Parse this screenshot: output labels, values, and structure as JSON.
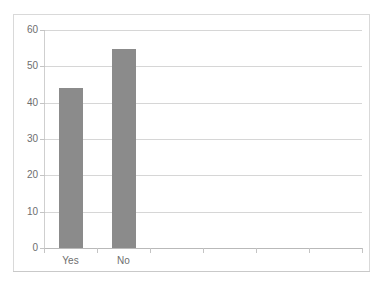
{
  "title_fragment": "",
  "chart_data": {
    "type": "bar",
    "title": "",
    "subtitle": "",
    "xlabel": "",
    "ylabel": "",
    "categories": [
      "Yes",
      "No"
    ],
    "values": [
      44,
      54.7
    ],
    "series": [
      {
        "name": "Response",
        "values": [
          44,
          54.7
        ]
      }
    ],
    "ylim": [
      0,
      60
    ],
    "y_ticks": [
      0,
      10,
      20,
      30,
      40,
      50,
      60
    ],
    "y_tick_labels": [
      "0",
      "10",
      "20",
      "30",
      "40",
      "50",
      "60"
    ],
    "grid": true,
    "legend": false,
    "legend_position": "none",
    "bar_color": "#8b8b8b",
    "gridline_color": "#d6d6d6",
    "axis_text_color": "#6e6e6e",
    "plot_background": "#ffffff",
    "frame_color": "#d9d9d9",
    "n_categories": 2,
    "empty_category_slots": 4
  }
}
